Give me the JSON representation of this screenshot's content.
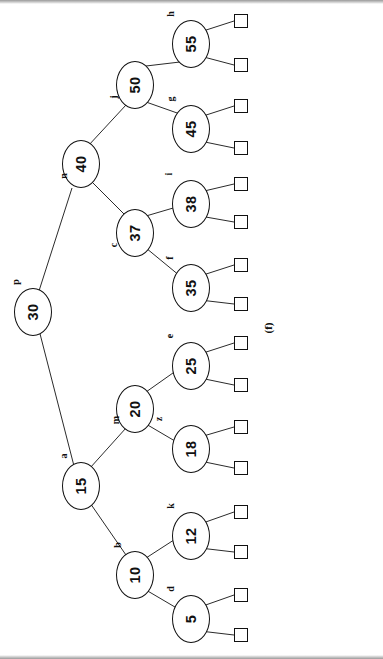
{
  "figure": {
    "caption": "(f)",
    "orientation": "rotated-90-ccw",
    "colors": {
      "stroke": "#111111",
      "background": "#ffffff"
    }
  },
  "nodes": [
    {
      "id": "n30",
      "key": "30",
      "tag": "p",
      "x": 14,
      "y": 288,
      "tag_x": 13,
      "tag_y": 277
    },
    {
      "id": "n15",
      "key": "15",
      "tag": "a",
      "x": 62,
      "y": 462,
      "tag_x": 61,
      "tag_y": 451
    },
    {
      "id": "n40",
      "key": "40",
      "tag": "n",
      "x": 62,
      "y": 140,
      "tag_x": 61,
      "tag_y": 171
    },
    {
      "id": "n10",
      "key": "10",
      "tag": "b",
      "x": 116,
      "y": 551,
      "tag_x": 115,
      "tag_y": 540
    },
    {
      "id": "n20",
      "key": "20",
      "tag": "m",
      "x": 116,
      "y": 385,
      "tag_x": 112,
      "tag_y": 415
    },
    {
      "id": "n37",
      "key": "37",
      "tag": "c",
      "x": 116,
      "y": 209,
      "tag_x": 112,
      "tag_y": 240
    },
    {
      "id": "n50",
      "key": "50",
      "tag": "j",
      "x": 116,
      "y": 61,
      "tag_x": 112,
      "tag_y": 92
    },
    {
      "id": "n5",
      "key": "5",
      "tag": "d",
      "x": 172,
      "y": 595,
      "tag_x": 168,
      "tag_y": 584
    },
    {
      "id": "n12",
      "key": "12",
      "tag": "k",
      "x": 172,
      "y": 512,
      "tag_x": 168,
      "tag_y": 501
    },
    {
      "id": "n18",
      "key": "18",
      "tag": "z",
      "x": 172,
      "y": 425,
      "tag_x": 157,
      "tag_y": 414
    },
    {
      "id": "n25",
      "key": "25",
      "tag": "e",
      "x": 172,
      "y": 342,
      "tag_x": 168,
      "tag_y": 331
    },
    {
      "id": "n35",
      "key": "35",
      "tag": "f",
      "x": 172,
      "y": 264,
      "tag_x": 168,
      "tag_y": 253
    },
    {
      "id": "n38",
      "key": "38",
      "tag": "i",
      "x": 172,
      "y": 180,
      "tag_x": 168,
      "tag_y": 169
    },
    {
      "id": "n45",
      "key": "45",
      "tag": "g",
      "x": 172,
      "y": 105,
      "tag_x": 168,
      "tag_y": 94
    },
    {
      "id": "n55",
      "key": "55",
      "tag": "h",
      "x": 172,
      "y": 20,
      "tag_x": 168,
      "tag_y": 9
    }
  ],
  "leaves": [
    {
      "id": "L1",
      "parent": "n55",
      "x": 234,
      "y": 14
    },
    {
      "id": "L2",
      "parent": "n55",
      "x": 234,
      "y": 58
    },
    {
      "id": "L3",
      "parent": "n45",
      "x": 234,
      "y": 99
    },
    {
      "id": "L4",
      "parent": "n45",
      "x": 234,
      "y": 141
    },
    {
      "id": "L5",
      "parent": "n38",
      "x": 234,
      "y": 177
    },
    {
      "id": "L6",
      "parent": "n38",
      "x": 234,
      "y": 215
    },
    {
      "id": "L7",
      "parent": "n35",
      "x": 234,
      "y": 258
    },
    {
      "id": "L8",
      "parent": "n35",
      "x": 234,
      "y": 297
    },
    {
      "id": "L9",
      "parent": "n25",
      "x": 234,
      "y": 336
    },
    {
      "id": "L10",
      "parent": "n25",
      "x": 234,
      "y": 378
    },
    {
      "id": "L11",
      "parent": "n18",
      "x": 234,
      "y": 420
    },
    {
      "id": "L12",
      "parent": "n18",
      "x": 234,
      "y": 461
    },
    {
      "id": "L13",
      "parent": "n12",
      "x": 234,
      "y": 505
    },
    {
      "id": "L14",
      "parent": "n12",
      "x": 234,
      "y": 545
    },
    {
      "id": "L15",
      "parent": "n5",
      "x": 234,
      "y": 588
    },
    {
      "id": "L16",
      "parent": "n5",
      "x": 234,
      "y": 628
    }
  ],
  "edges": [
    {
      "from": "n30",
      "to": "n40",
      "x1": 38,
      "y1": 294,
      "x2": 72,
      "y2": 188
    },
    {
      "from": "n30",
      "to": "n15",
      "x1": 38,
      "y1": 326,
      "x2": 74,
      "y2": 466
    },
    {
      "from": "n40",
      "to": "n50",
      "x1": 88,
      "y1": 146,
      "x2": 126,
      "y2": 105
    },
    {
      "from": "n40",
      "to": "n37",
      "x1": 90,
      "y1": 180,
      "x2": 126,
      "y2": 216
    },
    {
      "from": "n15",
      "to": "n20",
      "x1": 90,
      "y1": 468,
      "x2": 126,
      "y2": 428
    },
    {
      "from": "n15",
      "to": "n10",
      "x1": 88,
      "y1": 500,
      "x2": 126,
      "y2": 555
    },
    {
      "from": "n50",
      "to": "n55",
      "x1": 146,
      "y1": 66,
      "x2": 180,
      "y2": 62
    },
    {
      "from": "n50",
      "to": "n45",
      "x1": 146,
      "y1": 102,
      "x2": 180,
      "y2": 114
    },
    {
      "from": "n37",
      "to": "n38",
      "x1": 146,
      "y1": 216,
      "x2": 180,
      "y2": 206
    },
    {
      "from": "n37",
      "to": "n35",
      "x1": 146,
      "y1": 248,
      "x2": 180,
      "y2": 276
    },
    {
      "from": "n20",
      "to": "n25",
      "x1": 146,
      "y1": 392,
      "x2": 180,
      "y2": 368
    },
    {
      "from": "n20",
      "to": "n18",
      "x1": 146,
      "y1": 424,
      "x2": 180,
      "y2": 444
    },
    {
      "from": "n10",
      "to": "n12",
      "x1": 146,
      "y1": 558,
      "x2": 180,
      "y2": 536
    },
    {
      "from": "n10",
      "to": "n5",
      "x1": 146,
      "y1": 590,
      "x2": 180,
      "y2": 610
    },
    {
      "from": "n55",
      "to": "L1",
      "x1": 200,
      "y1": 32,
      "x2": 234,
      "y2": 21
    },
    {
      "from": "n55",
      "to": "L2",
      "x1": 200,
      "y1": 56,
      "x2": 234,
      "y2": 65
    },
    {
      "from": "n45",
      "to": "L3",
      "x1": 200,
      "y1": 117,
      "x2": 234,
      "y2": 106
    },
    {
      "from": "n45",
      "to": "L4",
      "x1": 200,
      "y1": 141,
      "x2": 234,
      "y2": 148
    },
    {
      "from": "n38",
      "to": "L5",
      "x1": 200,
      "y1": 192,
      "x2": 234,
      "y2": 184
    },
    {
      "from": "n38",
      "to": "L6",
      "x1": 200,
      "y1": 216,
      "x2": 234,
      "y2": 222
    },
    {
      "from": "n35",
      "to": "L7",
      "x1": 200,
      "y1": 276,
      "x2": 234,
      "y2": 265
    },
    {
      "from": "n35",
      "to": "L8",
      "x1": 200,
      "y1": 300,
      "x2": 234,
      "y2": 304
    },
    {
      "from": "n25",
      "to": "L9",
      "x1": 200,
      "y1": 354,
      "x2": 234,
      "y2": 343
    },
    {
      "from": "n25",
      "to": "L10",
      "x1": 200,
      "y1": 378,
      "x2": 234,
      "y2": 385
    },
    {
      "from": "n18",
      "to": "L11",
      "x1": 200,
      "y1": 437,
      "x2": 234,
      "y2": 427
    },
    {
      "from": "n18",
      "to": "L12",
      "x1": 200,
      "y1": 461,
      "x2": 234,
      "y2": 468
    },
    {
      "from": "n12",
      "to": "L13",
      "x1": 200,
      "y1": 524,
      "x2": 234,
      "y2": 512
    },
    {
      "from": "n12",
      "to": "L14",
      "x1": 200,
      "y1": 548,
      "x2": 234,
      "y2": 552
    },
    {
      "from": "n5",
      "to": "L15",
      "x1": 200,
      "y1": 607,
      "x2": 234,
      "y2": 595
    },
    {
      "from": "n5",
      "to": "L16",
      "x1": 200,
      "y1": 631,
      "x2": 234,
      "y2": 635
    }
  ],
  "caption_pos": {
    "x": 262,
    "y": 322
  }
}
